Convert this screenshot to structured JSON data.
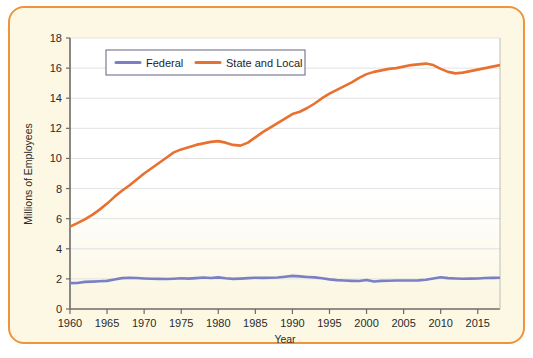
{
  "figure": {
    "border_color": "#f0943c",
    "card_background": "#fdf8e3",
    "plot_background_top": "#ffffff",
    "plot_background_bottom": "#fbf6dd"
  },
  "chart_data": {
    "type": "line",
    "title": "",
    "xlabel": "Year",
    "ylabel": "Millions of Employees",
    "xlim": [
      1960,
      2018
    ],
    "ylim": [
      0,
      18
    ],
    "ytick_labels": [
      "0",
      "2",
      "4",
      "6",
      "8",
      "10",
      "12",
      "14",
      "16",
      "18"
    ],
    "yticks": [
      0,
      2,
      4,
      6,
      8,
      10,
      12,
      14,
      16,
      18
    ],
    "xtick_labels": [
      "1960",
      "1965",
      "1970",
      "1975",
      "1980",
      "1985",
      "1990",
      "1995",
      "2000",
      "2005",
      "2010",
      "2015"
    ],
    "xticks": [
      1960,
      1965,
      1970,
      1975,
      1980,
      1985,
      1990,
      1995,
      2000,
      2005,
      2010,
      2015
    ],
    "grid": "horizontal",
    "legend_position": "top-center",
    "x": [
      1960,
      1961,
      1962,
      1963,
      1964,
      1965,
      1966,
      1967,
      1968,
      1969,
      1970,
      1971,
      1972,
      1973,
      1974,
      1975,
      1976,
      1977,
      1978,
      1979,
      1980,
      1981,
      1982,
      1983,
      1984,
      1985,
      1986,
      1987,
      1988,
      1989,
      1990,
      1991,
      1992,
      1993,
      1994,
      1995,
      1996,
      1997,
      1998,
      1999,
      2000,
      2001,
      2002,
      2003,
      2004,
      2005,
      2006,
      2007,
      2008,
      2009,
      2010,
      2011,
      2012,
      2013,
      2014,
      2015,
      2016,
      2017,
      2018
    ],
    "series": [
      {
        "name": "Federal",
        "color": "#7b7fc4",
        "values": [
          1.72,
          1.73,
          1.8,
          1.82,
          1.84,
          1.87,
          1.96,
          2.05,
          2.08,
          2.06,
          2.03,
          2.01,
          2.0,
          1.99,
          2.01,
          2.04,
          2.02,
          2.05,
          2.09,
          2.06,
          2.1,
          2.04,
          2.0,
          2.02,
          2.05,
          2.08,
          2.07,
          2.08,
          2.09,
          2.14,
          2.2,
          2.17,
          2.13,
          2.1,
          2.04,
          1.97,
          1.92,
          1.89,
          1.87,
          1.86,
          1.93,
          1.83,
          1.87,
          1.88,
          1.89,
          1.89,
          1.89,
          1.9,
          1.94,
          2.03,
          2.11,
          2.05,
          2.03,
          2.01,
          2.02,
          2.03,
          2.06,
          2.07,
          2.08
        ]
      },
      {
        "name": "State and Local",
        "color": "#e8712f",
        "values": [
          5.47,
          5.7,
          5.95,
          6.25,
          6.6,
          7.0,
          7.45,
          7.85,
          8.2,
          8.6,
          9.0,
          9.35,
          9.7,
          10.05,
          10.4,
          10.6,
          10.75,
          10.9,
          11.0,
          11.1,
          11.15,
          11.05,
          10.9,
          10.85,
          11.05,
          11.4,
          11.75,
          12.05,
          12.35,
          12.65,
          12.95,
          13.1,
          13.35,
          13.65,
          14.0,
          14.3,
          14.55,
          14.8,
          15.05,
          15.35,
          15.6,
          15.75,
          15.85,
          15.95,
          16.0,
          16.1,
          16.2,
          16.25,
          16.3,
          16.2,
          15.95,
          15.75,
          15.65,
          15.7,
          15.8,
          15.9,
          16.0,
          16.1,
          16.2
        ]
      }
    ]
  }
}
